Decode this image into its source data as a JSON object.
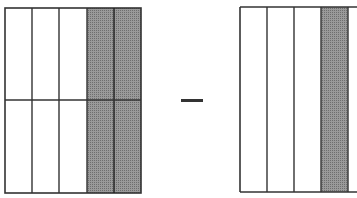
{
  "diagram": {
    "operator": "minus",
    "left_model": {
      "columns": 5,
      "rows": 2,
      "shaded_columns": [
        3,
        4
      ],
      "shaded_parts": 4,
      "total_parts": 10
    },
    "right_model": {
      "columns_visible": 4,
      "rows": 1,
      "shaded_columns": [
        3
      ],
      "cut_off_right": true
    },
    "colors": {
      "line": "#333333",
      "shade": "#8c8c8c",
      "background": "#ffffff"
    }
  }
}
